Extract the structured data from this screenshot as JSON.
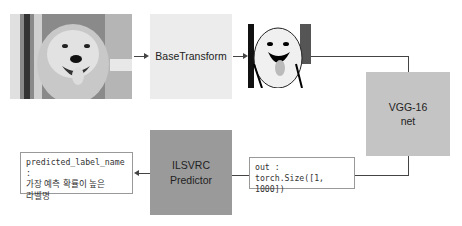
{
  "diagram": {
    "nodes": {
      "input_image": {
        "label": "golden retriever photo"
      },
      "base_transform": {
        "label": "BaseTransform",
        "color": "#ececec"
      },
      "transformed_image": {
        "label": "transformed dog image"
      },
      "vgg": {
        "line1": "VGG-16",
        "line2": "net",
        "color": "#c4c4c4"
      },
      "output": {
        "line1": "out :",
        "line2": "torch.Size([1, 1000])"
      },
      "predictor": {
        "line1": "ILSVRC",
        "line2": "Predictor",
        "color": "#9a9a9a"
      },
      "result": {
        "line1": "predicted_label_name :",
        "line2": "가장 예측 확률이 높은",
        "line3": "라벨명"
      }
    },
    "edges": [
      {
        "from": "input_image",
        "to": "base_transform"
      },
      {
        "from": "base_transform",
        "to": "transformed_image"
      },
      {
        "from": "transformed_image",
        "to": "vgg"
      },
      {
        "from": "vgg",
        "to": "output"
      },
      {
        "from": "output",
        "to": "predictor"
      },
      {
        "from": "predictor",
        "to": "result"
      }
    ]
  }
}
